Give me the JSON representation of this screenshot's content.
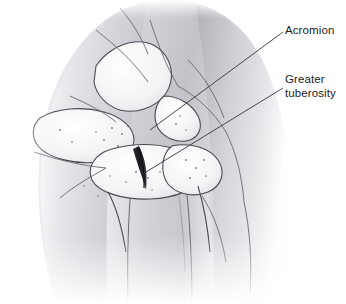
{
  "figure": {
    "style": "grayscale medical line drawing with tonal shading",
    "background_color": "#ffffff",
    "line_color": "#4a4a52",
    "skin_shade_light": "#f2f2f4",
    "skin_shade_mid": "#c9c9ce",
    "skin_shade_dark": "#9a9aa1",
    "label_color": "#1b1b1b"
  },
  "labels": [
    {
      "id": "acromion",
      "text": "Acromion",
      "lines": [
        "Acromion"
      ],
      "x": 285,
      "y": 24,
      "leader_from": [
        283,
        32
      ],
      "leader_to": [
        150,
        130
      ]
    },
    {
      "id": "greater-tuberosity",
      "text": "Greater tuberosity",
      "lines": [
        "Greater",
        "tuberosity"
      ],
      "x": 285,
      "y": 73,
      "leader_from": [
        283,
        88
      ],
      "leader_to": [
        146,
        172
      ]
    }
  ],
  "structures": [
    {
      "name": "deltoid-muscle-silhouette",
      "description": "large rounded shoulder contour filling the frame"
    },
    {
      "name": "acromion-process",
      "description": "bony shelf above the humeral head"
    },
    {
      "name": "clavicle",
      "description": "upper contour crossing toward the neck"
    },
    {
      "name": "humeral-head",
      "description": "rounded articular surface at the glenohumeral joint"
    },
    {
      "name": "greater-tuberosity",
      "description": "lateral bony prominence of the proximal humerus"
    },
    {
      "name": "humeral-shaft",
      "description": "long bone descending to the lower frame"
    },
    {
      "name": "fracture-line",
      "description": "dark elongated spindle marking in the joint region"
    },
    {
      "name": "glenohumeral-joint-space",
      "description": "gap between humeral head and glenoid"
    }
  ]
}
